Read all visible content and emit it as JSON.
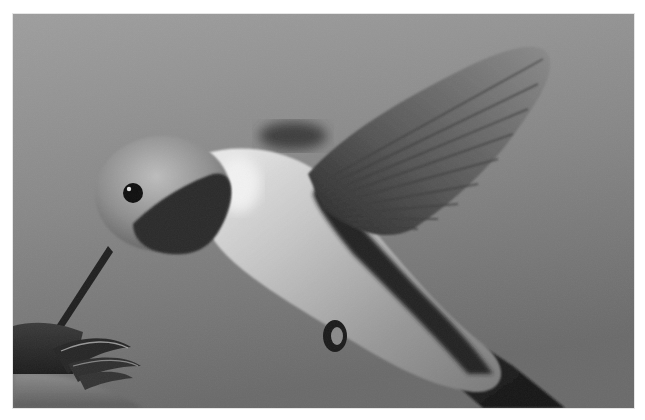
{
  "image": {
    "alt": "Grayscale photograph of a hummingbird hovering and feeding at a feeder flower",
    "subject": "hummingbird",
    "mode": "grayscale",
    "elements": [
      "hummingbird-head",
      "eye",
      "bill",
      "gorget",
      "body",
      "wing",
      "motion-blurred-wing",
      "foot",
      "tail",
      "feeder-flower",
      "feeder-base"
    ]
  },
  "colors": {
    "border": "#ffffff",
    "background_top": "#9c9c9c",
    "background_bottom": "#6c6c6c",
    "wing": "#5a5a5a",
    "gorget": "#2c2c2c",
    "body_highlight": "#e4e4e4",
    "tail": "#1e1e1e"
  }
}
